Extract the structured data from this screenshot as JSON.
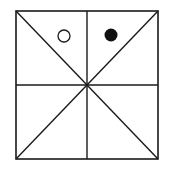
{
  "diagram": {
    "colors": {
      "background": "#ffffff",
      "line": "#1a1a1a",
      "filled_circle": "#111111",
      "open_circle_fill": "#ffffff"
    },
    "square": {
      "x1": 16,
      "y1": 11,
      "x2": 158,
      "y2": 159
    },
    "center": {
      "x": 87,
      "y": 85
    },
    "circles": [
      {
        "kind": "open",
        "cx": 64,
        "cy": 36,
        "r": 6
      },
      {
        "kind": "filled",
        "cx": 111,
        "cy": 35,
        "r": 6.5
      }
    ]
  }
}
